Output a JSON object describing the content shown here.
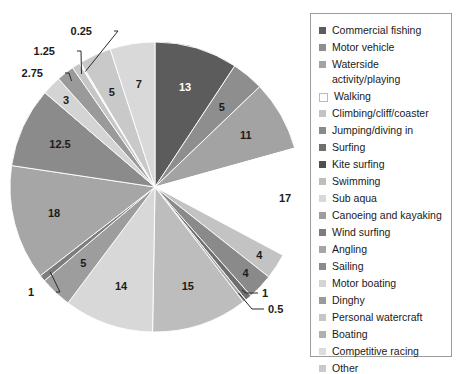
{
  "chart_data": {
    "type": "pie",
    "title": "",
    "start_angle_deg": 0,
    "direction": "clockwise",
    "legend_position": "right",
    "grid": false,
    "categories": [
      "Commercial fishing",
      "Motor vehicle",
      "Waterside activity/playing",
      "Walking",
      "Climbing/cliff/coaster",
      "Jumping/diving in",
      "Surfing",
      "Kite surfing",
      "Swimming",
      "Sub aqua",
      "Canoeing and kayaking",
      "Wind surfing",
      "Angling",
      "Sailing",
      "Motor boating",
      "Dinghy",
      "Personal watercraft",
      "Boating",
      "Competitive racing",
      "Other"
    ],
    "values": [
      13,
      5,
      11,
      17,
      4,
      4,
      1,
      0.5,
      15,
      14,
      5,
      1,
      18,
      12.5,
      3,
      2.75,
      1.25,
      0.25,
      5,
      7
    ],
    "labels": [
      "13",
      "5",
      "11",
      "17",
      "4",
      "4",
      "1",
      "0.5",
      "15",
      "14",
      "5",
      "1",
      "18",
      "12.5",
      "3",
      "2.75",
      "1.25",
      "0.25",
      "5",
      "7"
    ],
    "colors": [
      "#5c5c5c",
      "#8e8e8e",
      "#a3a3a3",
      "#ffffff",
      "#c3c3c3",
      "#8a8a8a",
      "#6f6f6f",
      "#a8a8a8",
      "#bdbdbd",
      "#d8d8d8",
      "#9d9d9d",
      "#7d7d7d",
      "#a6a6a6",
      "#8b8b8b",
      "#d4d4d4",
      "#9a9a9a",
      "#c6c6c6",
      "#efefef",
      "#c9c9c9",
      "#d9d9d9"
    ],
    "xlabel": "",
    "ylabel": ""
  },
  "legend": {
    "items": [
      {
        "label": "Commercial fishing",
        "color": "#5c5c5c"
      },
      {
        "label": "Motor vehicle",
        "color": "#8e8e8e"
      },
      {
        "label": "Waterside activity/playing",
        "color": "#a3a3a3"
      },
      {
        "label": "Walking",
        "color": "#ffffff"
      },
      {
        "label": "Climbing/cliff/coaster",
        "color": "#c3c3c3"
      },
      {
        "label": "Jumping/diving in",
        "color": "#8a8a8a"
      },
      {
        "label": "Surfing",
        "color": "#6f6f6f"
      },
      {
        "label": "Kite surfing",
        "color": "#4f4f4f"
      },
      {
        "label": "Swimming",
        "color": "#bdbdbd"
      },
      {
        "label": "Sub aqua",
        "color": "#d8d8d8"
      },
      {
        "label": "Canoeing and kayaking",
        "color": "#9d9d9d"
      },
      {
        "label": "Wind surfing",
        "color": "#7d7d7d"
      },
      {
        "label": "Angling",
        "color": "#a6a6a6"
      },
      {
        "label": "Sailing",
        "color": "#8b8b8b"
      },
      {
        "label": "Motor boating",
        "color": "#d4d4d4"
      },
      {
        "label": "Dinghy",
        "color": "#9a9a9a"
      },
      {
        "label": "Personal watercraft",
        "color": "#c6c6c6"
      },
      {
        "label": "Boating",
        "color": "#b0b0b0"
      },
      {
        "label": "Competitive racing",
        "color": "#dcdcdc"
      },
      {
        "label": "Other",
        "color": "#c9c9c9"
      }
    ]
  },
  "pie_geometry": {
    "cx": 155,
    "cy": 187,
    "r": 145
  }
}
